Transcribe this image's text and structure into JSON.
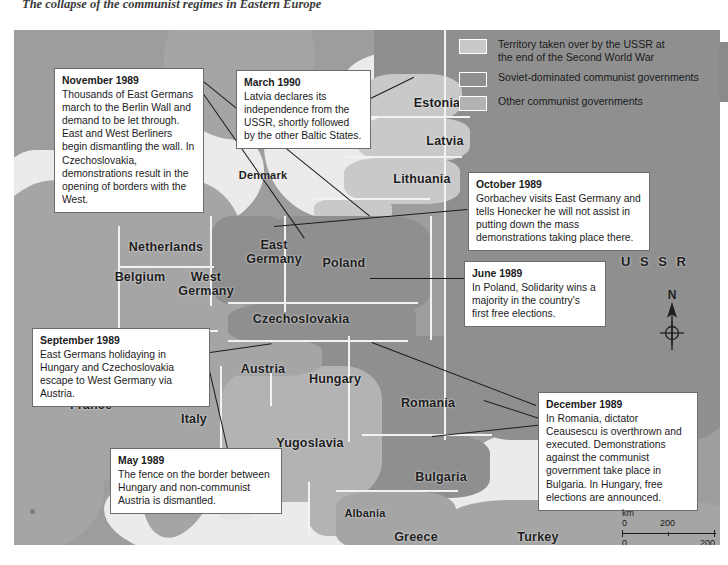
{
  "page": {
    "title": "The collapse of the communist regimes in Eastern Europe"
  },
  "legend": {
    "items": [
      {
        "label": "Territory taken over by the USSR at\nthe end of the Second World War",
        "color": "#c9c9c9"
      },
      {
        "label": "Soviet-dominated communist governments",
        "color": "#8f8f8f"
      },
      {
        "label": "Other communist governments",
        "color": "#b3b3b3"
      }
    ]
  },
  "countries": [
    {
      "name": "Estonia",
      "x": 388,
      "y": 66,
      "w": 70
    },
    {
      "name": "Latvia",
      "x": 396,
      "y": 104,
      "w": 70
    },
    {
      "name": "Lithuania",
      "x": 360,
      "y": 142,
      "w": 96
    },
    {
      "name": "Denmark",
      "x": 206,
      "y": 138,
      "w": 86
    },
    {
      "name": "Netherlands",
      "x": 98,
      "y": 210,
      "w": 108
    },
    {
      "name": "Belgium",
      "x": 84,
      "y": 240,
      "w": 84
    },
    {
      "name": "West\nGermany",
      "x": 152,
      "y": 240,
      "w": 80
    },
    {
      "name": "East\nGermany",
      "x": 222,
      "y": 208,
      "w": 76
    },
    {
      "name": "Poland",
      "x": 290,
      "y": 226,
      "w": 80
    },
    {
      "name": "Czechoslovakia",
      "x": 224,
      "y": 282,
      "w": 126
    },
    {
      "name": "Austria",
      "x": 214,
      "y": 332,
      "w": 70
    },
    {
      "name": "Hungary",
      "x": 280,
      "y": 342,
      "w": 82
    },
    {
      "name": "Romania",
      "x": 372,
      "y": 366,
      "w": 84
    },
    {
      "name": "Yugoslavia",
      "x": 246,
      "y": 406,
      "w": 100
    },
    {
      "name": "Bulgaria",
      "x": 388,
      "y": 440,
      "w": 78
    },
    {
      "name": "Albania",
      "x": 316,
      "y": 476,
      "w": 70
    },
    {
      "name": "Greece",
      "x": 368,
      "y": 500,
      "w": 68
    },
    {
      "name": "Turkey",
      "x": 492,
      "y": 500,
      "w": 64
    },
    {
      "name": "France",
      "x": 38,
      "y": 368,
      "w": 78
    },
    {
      "name": "Italy",
      "x": 150,
      "y": 382,
      "w": 60
    },
    {
      "name": "U S S R",
      "x": 596,
      "y": 225,
      "w": 90
    }
  ],
  "callouts": [
    {
      "id": "november-1989",
      "heading": "November 1989",
      "body": "Thousands of East Germans march to the Berlin Wall and demand to be let through. East and West Berliners begin dismantling the wall. In Czechoslovakia, demonstrations result in the opening of borders with the West.",
      "x": 40,
      "y": 38,
      "w": 150
    },
    {
      "id": "march-1990",
      "heading": "March 1990",
      "body": "Latvia declares its independence from the USSR, shortly followed by the other Baltic States.",
      "x": 222,
      "y": 40,
      "w": 135
    },
    {
      "id": "october-1989",
      "heading": "October 1989",
      "body": "Gorbachev visits East Germany and tells Honecker he will not assist in putting down the mass demonstrations taking place there.",
      "x": 454,
      "y": 142,
      "w": 182
    },
    {
      "id": "june-1989",
      "heading": "June 1989",
      "body": "In Poland, Solidarity wins a majority in the country's first free elections.",
      "x": 450,
      "y": 231,
      "w": 142
    },
    {
      "id": "september-1989",
      "heading": "September 1989",
      "body": "East Germans holidaying in Hungary and Czechoslovakia escape to West Germany via Austria.",
      "x": 18,
      "y": 298,
      "w": 178
    },
    {
      "id": "december-1989",
      "heading": "December 1989",
      "body": "In Romania, dictator Ceausescu is overthrown and executed. Demonstrations against the communist government take place in Bulgaria. In Hungary, free elections are announced.",
      "x": 524,
      "y": 362,
      "w": 160
    },
    {
      "id": "may-1989",
      "heading": "May 1989",
      "body": "The fence on the border between Hungary and non-communist Austria is dismantled.",
      "x": 96,
      "y": 418,
      "w": 172
    }
  ],
  "compass": {
    "label": "N"
  },
  "scale": {
    "km_label": "km",
    "miles_label": "miles",
    "km_zero": "0",
    "km_max": "200",
    "miles_zero": "0",
    "miles_max": "200"
  },
  "colors": {
    "soviet_dominated": "#8f8f8f",
    "other_communist": "#b3b3b3",
    "ussr_annexed": "#c9c9c9",
    "sea": "#eceaea",
    "map_background": "#9d9d9d",
    "callout_border": "#6d6d6d"
  }
}
